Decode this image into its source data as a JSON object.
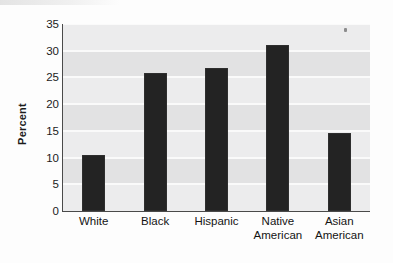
{
  "figure": {
    "background_color": "#fdfdfd",
    "plot_background_color": "#ececed",
    "band_color": "#e2e2e3",
    "gridline_color": "#fafafa",
    "bar_color": "#232323",
    "axis_color": "#4a4a4a"
  },
  "chart_data": {
    "type": "bar",
    "title": "",
    "xlabel": "",
    "ylabel": "Percent",
    "categories": [
      "White",
      "Black",
      "Hispanic",
      "Native American",
      "Asian American"
    ],
    "category_lines": [
      [
        "White"
      ],
      [
        "Black"
      ],
      [
        "Hispanic"
      ],
      [
        "Native",
        "American"
      ],
      [
        "Asian",
        "American"
      ]
    ],
    "values": [
      10.5,
      25.8,
      26.7,
      31.0,
      14.6
    ],
    "ylim": [
      0,
      35
    ],
    "ytick_values": [
      0,
      5,
      10,
      15,
      20,
      25,
      30,
      35
    ],
    "ytick_labels": [
      "0",
      "5",
      "10",
      "15",
      "20",
      "25",
      "30",
      "35"
    ],
    "grid": true,
    "grid_axis": "y",
    "legend": false,
    "legend_position": "none",
    "orientation": "vertical"
  }
}
